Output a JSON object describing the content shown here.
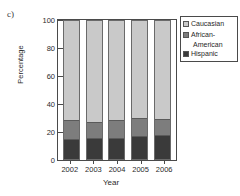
{
  "panel": {
    "label": "c)"
  },
  "chart_data": {
    "type": "bar",
    "stacked": true,
    "stack_mode": "percent",
    "title": "",
    "xlabel": "Year",
    "ylabel": "Percentage",
    "categories": [
      "2002",
      "2003",
      "2004",
      "2005",
      "2006"
    ],
    "ylim": [
      0,
      100
    ],
    "yticks": [
      0,
      20,
      40,
      60,
      80,
      100
    ],
    "ytick_labels": [
      "0",
      "20",
      "40",
      "60",
      "80",
      "100"
    ],
    "grid": false,
    "legend_position": "top-right",
    "series": [
      {
        "name": "Hispanic",
        "color": "#3a3a3a",
        "values": [
          14,
          15,
          15,
          16,
          17
        ]
      },
      {
        "name": "African-American",
        "color": "#7d7d7d",
        "values": [
          13,
          11,
          12,
          13,
          11
        ]
      },
      {
        "name": "Caucasian",
        "color": "#c9c9c9",
        "values": [
          73,
          74,
          73,
          71,
          72
        ]
      }
    ],
    "cumulative_tops": {
      "hispanic": [
        14,
        15,
        15,
        16,
        17
      ],
      "african_american": [
        27,
        26,
        27,
        29,
        28
      ],
      "caucasian": [
        100,
        100,
        100,
        100,
        100
      ]
    }
  },
  "legend": {
    "items": [
      {
        "label": "Caucasian",
        "label_cont": "",
        "color": "#c9c9c9"
      },
      {
        "label": "African-",
        "label_cont": "American",
        "color": "#7d7d7d"
      },
      {
        "label": "Hispanic",
        "label_cont": "",
        "color": "#3a3a3a"
      }
    ]
  }
}
